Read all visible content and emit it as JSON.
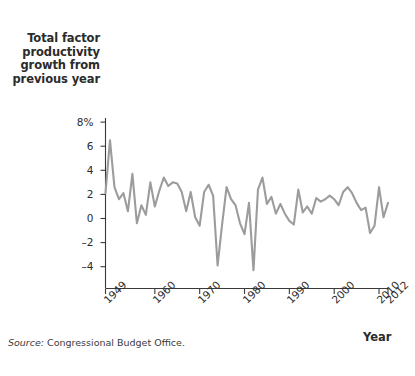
{
  "figure": {
    "y_axis_title_lines": [
      "Total factor",
      "productivity",
      "growth from",
      "previous year"
    ],
    "x_axis_title": "Year",
    "source_label": "Source:",
    "source_text": "Congressional Budget Office.",
    "line_color": "#9c9c9c",
    "axis_color": "#3a3a3a",
    "text_color": "#2b2b2b"
  },
  "chart_data": {
    "type": "line",
    "title": "Total factor productivity growth from previous year",
    "xlabel": "Year",
    "ylabel": "Total factor productivity growth from previous year",
    "xlim": [
      1949,
      2012
    ],
    "ylim": [
      -5,
      8
    ],
    "grid": false,
    "legend": null,
    "ytick_labels": [
      "8%",
      "6",
      "4",
      "2",
      "0",
      "-2",
      "-4"
    ],
    "ytick_values": [
      8,
      6,
      4,
      2,
      0,
      -2,
      -4
    ],
    "xtick_labels": [
      "1949",
      "1960",
      "1970",
      "1980",
      "1990",
      "2000",
      "2010",
      "2012"
    ],
    "xtick_values": [
      1949,
      1960,
      1970,
      1980,
      1990,
      2000,
      2010,
      2012
    ],
    "series": [
      {
        "name": "Total factor productivity growth",
        "x": [
          1949,
          1950,
          1951,
          1952,
          1953,
          1954,
          1955,
          1956,
          1957,
          1958,
          1959,
          1960,
          1961,
          1962,
          1963,
          1964,
          1965,
          1966,
          1967,
          1968,
          1969,
          1970,
          1971,
          1972,
          1973,
          1974,
          1975,
          1976,
          1977,
          1978,
          1979,
          1980,
          1981,
          1982,
          1983,
          1984,
          1985,
          1986,
          1987,
          1988,
          1989,
          1990,
          1991,
          1992,
          1993,
          1994,
          1995,
          1996,
          1997,
          1998,
          1999,
          2000,
          2001,
          2002,
          2003,
          2004,
          2005,
          2006,
          2007,
          2008,
          2009,
          2010,
          2011,
          2012
        ],
        "values": [
          2.1,
          6.5,
          2.6,
          1.6,
          2.1,
          0.6,
          3.7,
          -0.4,
          1.1,
          0.3,
          3.0,
          1.0,
          2.3,
          3.4,
          2.7,
          3.0,
          2.9,
          2.2,
          0.6,
          2.2,
          0.1,
          -0.6,
          2.2,
          2.8,
          1.9,
          -3.9,
          -0.5,
          2.6,
          1.6,
          1.1,
          -0.4,
          -1.3,
          1.3,
          -4.3,
          2.4,
          3.4,
          1.2,
          1.8,
          0.4,
          1.2,
          0.4,
          -0.2,
          -0.5,
          2.4,
          0.5,
          1.0,
          0.4,
          1.7,
          1.4,
          1.6,
          1.9,
          1.6,
          1.1,
          2.2,
          2.6,
          2.1,
          1.3,
          0.7,
          0.9,
          -1.2,
          -0.6,
          2.6,
          0.1,
          1.3
        ]
      }
    ]
  }
}
